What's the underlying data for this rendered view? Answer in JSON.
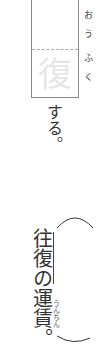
{
  "exercise": {
    "box_hint_char": "復",
    "box_furigana": [
      "お",
      "う",
      "ふ",
      "く"
    ],
    "after_box": "する。",
    "phrase_underlined": "往復",
    "phrase_rest": "の運賃。",
    "furigana_unchin": "うんちん"
  }
}
